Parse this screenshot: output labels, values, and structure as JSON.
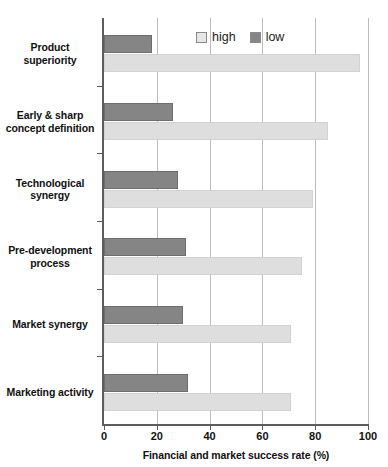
{
  "chart_data": {
    "type": "bar",
    "orientation": "horizontal",
    "title": "",
    "subtitle": "",
    "xlabel": "Financial and market success rate (%)",
    "ylabel": "",
    "xlim": [
      0,
      100
    ],
    "xticks": [
      0,
      20,
      40,
      60,
      80,
      100
    ],
    "xtick_labels": [
      "0",
      "20",
      "40",
      "60",
      "80",
      "100"
    ],
    "grid": "vertical",
    "legend_position": "top-center",
    "categories": [
      "Product superiority",
      "Early & sharp concept definition",
      "Technological synergy",
      "Pre-development process",
      "Market synergy",
      "Marketing activity"
    ],
    "category_lines": [
      [
        "Product",
        "superiority"
      ],
      [
        "Early & sharp",
        "concept definition"
      ],
      [
        "Technological",
        "synergy"
      ],
      [
        "Pre-development",
        "process"
      ],
      [
        "Market synergy"
      ],
      [
        "Marketing activity"
      ]
    ],
    "series": [
      {
        "name": "low",
        "color": "#858585",
        "values": [
          18,
          26,
          28,
          31,
          30,
          32
        ]
      },
      {
        "name": "high",
        "color": "#dedede",
        "values": [
          97,
          85,
          79,
          75,
          71,
          71
        ]
      }
    ]
  },
  "legend": {
    "entries": [
      {
        "label": "high",
        "color": "#dedede"
      },
      {
        "label": "low",
        "color": "#858585"
      }
    ]
  },
  "axis": {
    "x_title": "Financial and market success rate (%)",
    "tick_labels": [
      "0",
      "20",
      "40",
      "60",
      "80",
      "100"
    ]
  },
  "colors": {
    "high": "#dedede",
    "low": "#858585",
    "grid": "#bdbdbd",
    "axis": "#5d5d5d",
    "text": "#111111",
    "background": "#ffffff"
  }
}
